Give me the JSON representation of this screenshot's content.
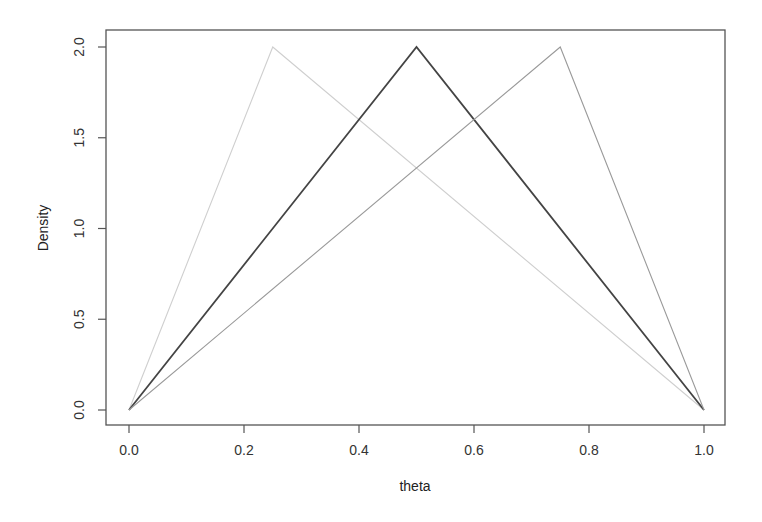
{
  "chart_data": {
    "type": "line",
    "title": "",
    "xlabel": "theta",
    "ylabel": "Density",
    "xlim": [
      0.0,
      1.0
    ],
    "ylim": [
      0.0,
      2.0
    ],
    "xticks": [
      "0.0",
      "0.2",
      "0.4",
      "0.6",
      "0.8",
      "1.0"
    ],
    "yticks": [
      "0.0",
      "0.5",
      "1.0",
      "1.5",
      "2.0"
    ],
    "grid": false,
    "legend": null,
    "series": [
      {
        "name": "triangular mode 0.25",
        "color": "#cfcfcf",
        "x": [
          0.0,
          0.25,
          1.0
        ],
        "y": [
          0.0,
          2.0,
          0.0
        ]
      },
      {
        "name": "triangular mode 0.5",
        "color": "#444444",
        "x": [
          0.0,
          0.5,
          1.0
        ],
        "y": [
          0.0,
          2.0,
          0.0
        ]
      },
      {
        "name": "triangular mode 0.75",
        "color": "#9a9a9a",
        "x": [
          0.0,
          0.75,
          1.0
        ],
        "y": [
          0.0,
          2.0,
          0.0
        ]
      }
    ]
  }
}
